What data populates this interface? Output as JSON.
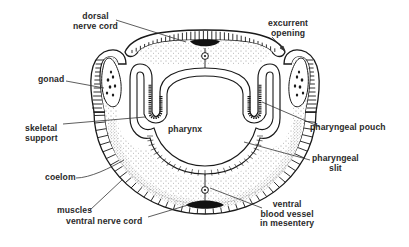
{
  "diagram": {
    "colors": {
      "ink": "#1a1a1a",
      "stipple": "#555555",
      "background": "#ffffff"
    },
    "labels": {
      "dorsal_nerve_cord": {
        "line1": "dorsal",
        "line2": "nerve cord"
      },
      "excurrent_opening": {
        "line1": "excurrent",
        "line2": "opening"
      },
      "gonad": "gonad",
      "skeletal_support": {
        "line1": "skeletal",
        "line2": "support"
      },
      "pharynx": "pharynx",
      "pharyngeal_pouch": "pharyngeal pouch",
      "pharyngeal_slit": {
        "line1": "pharyngeal",
        "line2": "slit"
      },
      "coelom": "coelom",
      "muscles": "muscles",
      "ventral_nerve_cord": "ventral nerve cord",
      "ventral_blood_vessel": {
        "line1": "ventral",
        "line2": "blood vessel",
        "line3": "in mesentery"
      }
    }
  }
}
